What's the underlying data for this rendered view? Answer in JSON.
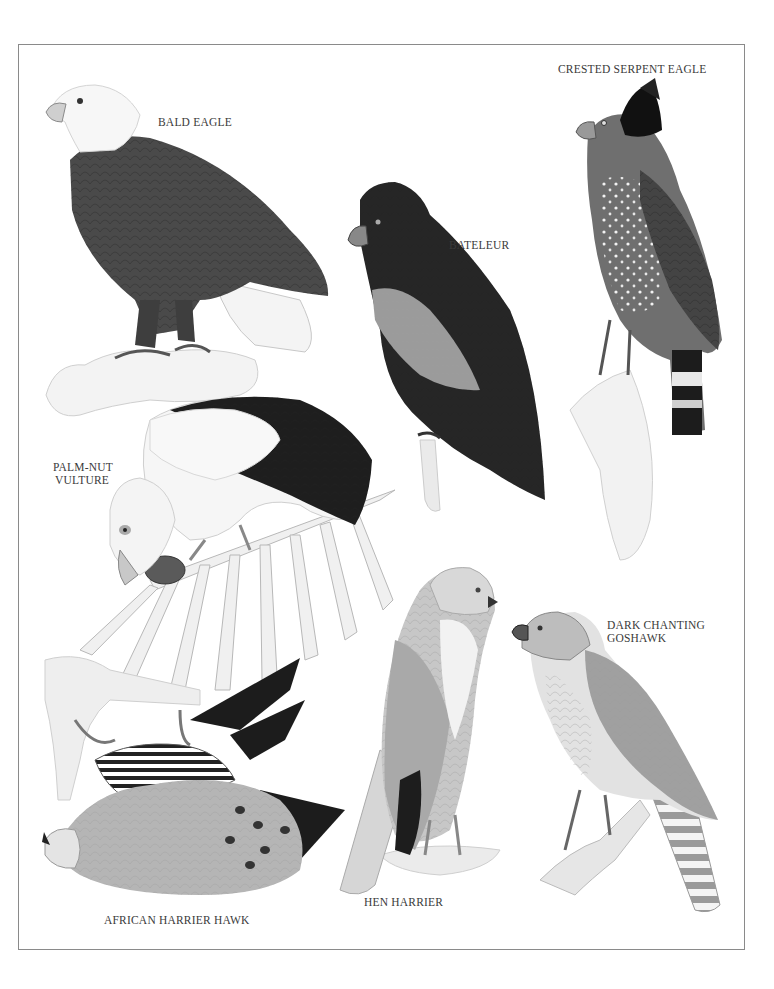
{
  "page": {
    "background": "#ffffff",
    "frame_color": "#8a8a8a",
    "text_color": "#3a3a3a"
  },
  "labels": {
    "bald_eagle": "BALD EAGLE",
    "crested_serpent_eagle": "CRESTED SERPENT EAGLE",
    "bateleur": "BATELEUR",
    "palm_nut_vulture_line1": "PALM-NUT",
    "palm_nut_vulture_line2": "VULTURE",
    "dark_chanting_goshawk_line1": "DARK CHANTING",
    "dark_chanting_goshawk_line2": "GOSHAWK",
    "hen_harrier": "HEN HARRIER",
    "african_harrier_hawk": "AFRICAN HARRIER HAWK"
  },
  "illustrations": [
    {
      "name": "Bald Eagle",
      "position": "top-left"
    },
    {
      "name": "Bateleur",
      "position": "top-center"
    },
    {
      "name": "Crested Serpent Eagle",
      "position": "top-right"
    },
    {
      "name": "Palm-nut Vulture",
      "position": "middle-left"
    },
    {
      "name": "African Harrier Hawk",
      "position": "bottom-left"
    },
    {
      "name": "Hen Harrier",
      "position": "bottom-center"
    },
    {
      "name": "Dark Chanting Goshawk",
      "position": "bottom-right"
    }
  ]
}
